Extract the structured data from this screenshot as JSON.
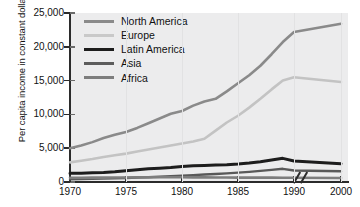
{
  "chart_data": {
    "type": "line",
    "title": "",
    "xlabel": "",
    "ylabel": "Per capita income in constant dollars",
    "xlim": [
      1970,
      2000
    ],
    "ylim": [
      0,
      25000
    ],
    "grid": "vertical-faint",
    "legend_position": "top-left-inside",
    "axis_break": {
      "axis": "x",
      "between": [
        1990,
        2000
      ],
      "symbol": "//"
    },
    "x_ticks": [
      1970,
      1975,
      1980,
      1985,
      1990,
      2000
    ],
    "x_tick_labels": [
      "1970",
      "1975",
      "1980",
      "1985",
      "1990",
      "2000"
    ],
    "y_ticks": [
      0,
      5000,
      10000,
      15000,
      20000,
      25000
    ],
    "y_tick_labels": [
      "0",
      "5,000",
      "10,000",
      "15,000",
      "20,000",
      "25,000"
    ],
    "x": [
      1970,
      1971,
      1972,
      1973,
      1974,
      1975,
      1976,
      1977,
      1978,
      1979,
      1980,
      1981,
      1982,
      1983,
      1984,
      1985,
      1986,
      1987,
      1988,
      1989,
      1990,
      2000
    ],
    "series": [
      {
        "name": "North America",
        "color": "#8a8a8a",
        "values": [
          5000,
          5400,
          5900,
          6500,
          7000,
          7400,
          8000,
          8700,
          9400,
          10100,
          10500,
          11300,
          11900,
          12300,
          13400,
          14600,
          15800,
          17200,
          18900,
          20700,
          22200,
          23400
        ]
      },
      {
        "name": "Europe",
        "color": "#c3c3c3",
        "values": [
          2900,
          3150,
          3400,
          3700,
          3950,
          4200,
          4500,
          4800,
          5100,
          5400,
          5700,
          6000,
          6400,
          7600,
          8800,
          9800,
          11000,
          12300,
          13700,
          15000,
          15500,
          14800
        ]
      },
      {
        "name": "Latin America",
        "color": "#1d1d1d",
        "values": [
          1300,
          1300,
          1350,
          1400,
          1500,
          1650,
          1800,
          1950,
          2050,
          2150,
          2300,
          2400,
          2450,
          2500,
          2550,
          2650,
          2800,
          3000,
          3250,
          3500,
          3100,
          2700
        ]
      },
      {
        "name": "Asia",
        "color": "#595959",
        "values": [
          400,
          430,
          460,
          500,
          540,
          600,
          660,
          720,
          790,
          860,
          940,
          1020,
          1100,
          1180,
          1280,
          1380,
          1500,
          1650,
          1800,
          1950,
          1700,
          1600
        ]
      },
      {
        "name": "Africa",
        "color": "#7d7d7d",
        "values": [
          620,
          630,
          640,
          650,
          660,
          670,
          680,
          690,
          700,
          700,
          700,
          690,
          680,
          670,
          660,
          650,
          650,
          640,
          640,
          630,
          620,
          600
        ]
      }
    ]
  },
  "legend": {
    "items": [
      {
        "label": "North America",
        "color": "#8a8a8a",
        "thickness": 3
      },
      {
        "label": "Europe",
        "color": "#c9c9c9",
        "thickness": 3
      },
      {
        "label": "Latin America",
        "color": "#1d1d1d",
        "thickness": 3.4
      },
      {
        "label": "Asia",
        "color": "#5c5c5c",
        "thickness": 3
      },
      {
        "label": "Africa",
        "color": "#7d7d7d",
        "thickness": 3
      }
    ]
  },
  "axes": {
    "y_title": "Per capita income in constant dollars",
    "y_labels": [
      "25,000",
      "20,000",
      "15,000",
      "10,000",
      "5,000",
      "0"
    ],
    "x_labels": [
      "1970",
      "1975",
      "1980",
      "1985",
      "1990",
      "2000"
    ]
  },
  "colors": {
    "plot_background": "#ececed",
    "page_background": "#ffffff",
    "axis": "#2b2b2b",
    "text": "#111111"
  }
}
